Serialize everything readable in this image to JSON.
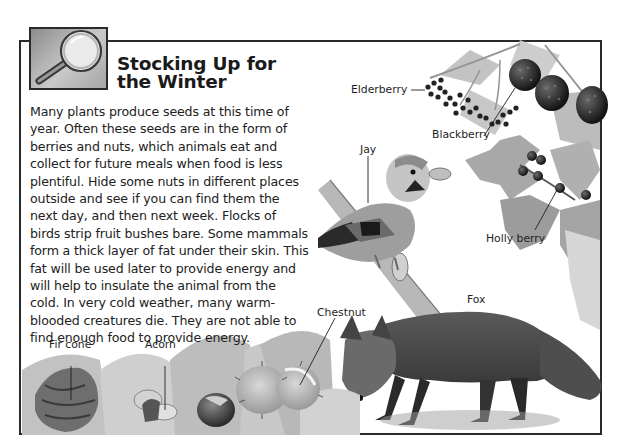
{
  "header": {
    "icon": "magnifying-glass-icon",
    "title_lines": [
      "Stocking Up for",
      "the Winter"
    ]
  },
  "body": {
    "lines": [
      "Many plants produce seeds at this time of",
      "year. Often these seeds are in the form of",
      "berries and nuts, which animals eat and",
      "collect for future meals when food is less",
      "plentiful. Hide some nuts in different places",
      "outside and see if you can find them the",
      "next day, and then next week. Flocks of",
      "birds strip fruit bushes bare. Some mammals",
      "form a thick layer of fat under their skin. This",
      "fat will be used later to provide energy and",
      "will help to insulate the animal from the",
      "cold. In very cold weather, many warm-",
      "blooded creatures die. They are not able to",
      "find enough food to provide energy."
    ]
  },
  "labels": {
    "elderberry": "Elderberry",
    "blackberry": "Blackberry",
    "jay": "Jay",
    "holly_berry": "Holly berry",
    "fox": "Fox",
    "chestnut": "Chestnut",
    "fir_cone": "Fir cone",
    "acorn": "Acorn"
  }
}
